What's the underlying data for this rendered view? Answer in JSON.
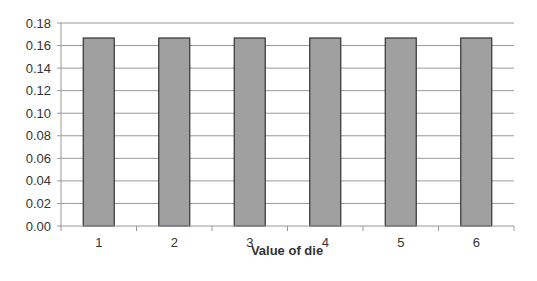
{
  "chart_data": {
    "type": "bar",
    "title": "",
    "xlabel": "Value of die",
    "ylabel": "",
    "categories": [
      "1",
      "2",
      "3",
      "4",
      "5",
      "6"
    ],
    "values": [
      0.1667,
      0.1667,
      0.1667,
      0.1667,
      0.1667,
      0.1667
    ],
    "ylim": [
      0,
      0.18
    ],
    "yticks": [
      "0.00",
      "0.02",
      "0.04",
      "0.06",
      "0.08",
      "0.10",
      "0.12",
      "0.14",
      "0.16",
      "0.18"
    ],
    "grid": true,
    "legend": null,
    "colors": {
      "bar_fill": "#a0a0a0",
      "bar_stroke": "#333333",
      "grid": "#999999",
      "axis": "#999999"
    }
  }
}
